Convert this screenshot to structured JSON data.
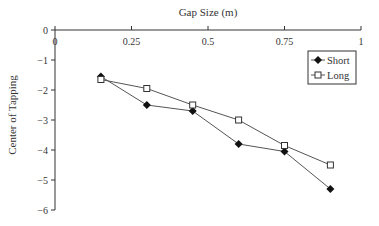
{
  "chart_data": {
    "type": "line",
    "title": "",
    "xlabel": "Gap Size (m)",
    "ylabel": "Center of Tapping",
    "xlim": [
      0,
      1
    ],
    "ylim": [
      -6,
      0
    ],
    "x_ticks": [
      "0",
      "0.25",
      "0.5",
      "0.75",
      "1"
    ],
    "y_ticks": [
      "0",
      "-1",
      "-2",
      "-3",
      "-4",
      "-5",
      "-6"
    ],
    "x_axis_position": "top",
    "grid": false,
    "legend_position": "upper right",
    "x": [
      0.15,
      0.3,
      0.45,
      0.6,
      0.75,
      0.9
    ],
    "series": [
      {
        "name": "Short",
        "marker": "filled-diamond",
        "values": [
          -1.55,
          -2.5,
          -2.7,
          -3.8,
          -4.05,
          -5.3
        ]
      },
      {
        "name": "Long",
        "marker": "open-square",
        "values": [
          -1.65,
          -1.95,
          -2.5,
          -3.0,
          -3.85,
          -4.5
        ]
      }
    ]
  }
}
